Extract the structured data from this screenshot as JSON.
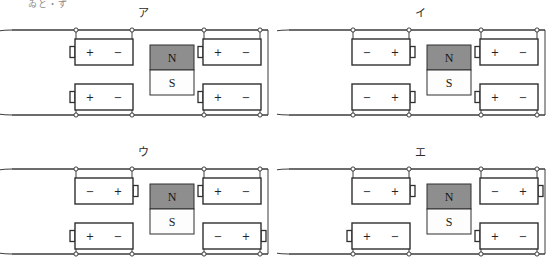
{
  "figure": {
    "stray_text": "ゐと・ず",
    "magnet": {
      "north_label": "N",
      "south_label": "S"
    },
    "colors": {
      "magnet_north_fill": "#8e8e8e",
      "magnet_south_fill": "#fdfdfd",
      "line": "#3c3c3c",
      "background": "#ffffff"
    },
    "panels": [
      {
        "id": "panel-a",
        "label": "ア",
        "batteries": [
          {
            "position": "top-left",
            "left_terminal": "+",
            "right_terminal": "−",
            "cap_side": "left"
          },
          {
            "position": "top-right",
            "left_terminal": "+",
            "right_terminal": "−",
            "cap_side": "left"
          },
          {
            "position": "bottom-left",
            "left_terminal": "+",
            "right_terminal": "−",
            "cap_side": "left"
          },
          {
            "position": "bottom-right",
            "left_terminal": "+",
            "right_terminal": "−",
            "cap_side": "left"
          }
        ]
      },
      {
        "id": "panel-i",
        "label": "イ",
        "batteries": [
          {
            "position": "top-left",
            "left_terminal": "−",
            "right_terminal": "+",
            "cap_side": "right"
          },
          {
            "position": "top-right",
            "left_terminal": "+",
            "right_terminal": "−",
            "cap_side": "left"
          },
          {
            "position": "bottom-left",
            "left_terminal": "−",
            "right_terminal": "+",
            "cap_side": "right"
          },
          {
            "position": "bottom-right",
            "left_terminal": "+",
            "right_terminal": "−",
            "cap_side": "left"
          }
        ]
      },
      {
        "id": "panel-u",
        "label": "ウ",
        "batteries": [
          {
            "position": "top-left",
            "left_terminal": "−",
            "right_terminal": "+",
            "cap_side": "right"
          },
          {
            "position": "top-right",
            "left_terminal": "+",
            "right_terminal": "−",
            "cap_side": "left"
          },
          {
            "position": "bottom-left",
            "left_terminal": "+",
            "right_terminal": "−",
            "cap_side": "left"
          },
          {
            "position": "bottom-right",
            "left_terminal": "−",
            "right_terminal": "+",
            "cap_side": "right"
          }
        ]
      },
      {
        "id": "panel-e",
        "label": "エ",
        "batteries": [
          {
            "position": "top-left",
            "left_terminal": "−",
            "right_terminal": "+",
            "cap_side": "right"
          },
          {
            "position": "top-right",
            "left_terminal": "−",
            "right_terminal": "+",
            "cap_side": "right"
          },
          {
            "position": "bottom-left",
            "left_terminal": "+",
            "right_terminal": "−",
            "cap_side": "left"
          },
          {
            "position": "bottom-right",
            "left_terminal": "+",
            "right_terminal": "−",
            "cap_side": "left"
          }
        ]
      }
    ]
  }
}
